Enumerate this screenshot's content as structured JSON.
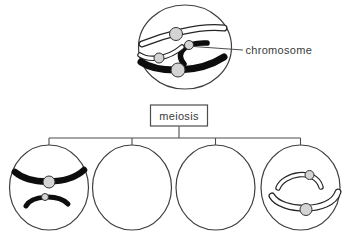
{
  "labels": {
    "chromosome_pointer": "chromosome",
    "process_box": "meiosis"
  },
  "colors": {
    "background": "#ffffff",
    "line": "#4d4d4d",
    "cell_outline": "#3f3f3f",
    "text": "#3a3a3a",
    "chromosome_dark": "#0d0d0d",
    "chromosome_light_outline": "#262626",
    "chromosome_light_fill": "#ffffff",
    "centromere_fill": "#d4d4d4",
    "centromere_outline": "#333333"
  },
  "cells": {
    "parent": {
      "chromosomes": [
        {
          "shade": "light",
          "size": "large"
        },
        {
          "shade": "light",
          "size": "small"
        },
        {
          "shade": "dark",
          "size": "small",
          "pointed_by_label": true
        },
        {
          "shade": "dark",
          "size": "large"
        }
      ]
    },
    "daughters": [
      {
        "position": 1,
        "chromosomes": [
          {
            "shade": "dark",
            "size": "large"
          },
          {
            "shade": "dark",
            "size": "small"
          }
        ]
      },
      {
        "position": 2,
        "chromosomes": []
      },
      {
        "position": 3,
        "chromosomes": []
      },
      {
        "position": 4,
        "chromosomes": [
          {
            "shade": "light",
            "size": "small"
          },
          {
            "shade": "light",
            "size": "large"
          }
        ]
      }
    ]
  }
}
